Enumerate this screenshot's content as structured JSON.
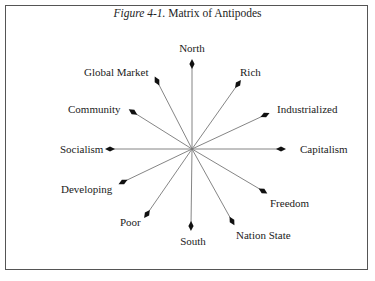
{
  "title": {
    "italic": "Figure 4-1.",
    "rest": " Matrix of Antipodes"
  },
  "center": [
    192,
    149
  ],
  "spokes": [
    {
      "label": "North",
      "tip": [
        192,
        64
      ],
      "lx": 192,
      "ly": 42,
      "anchor": "c"
    },
    {
      "label": "Rich",
      "tip": [
        238,
        84
      ],
      "lx": 240,
      "ly": 66,
      "anchor": "l"
    },
    {
      "label": "Industrialized",
      "tip": [
        265,
        115
      ],
      "lx": 277,
      "ly": 103,
      "anchor": "l"
    },
    {
      "label": "Capitalism",
      "tip": [
        281,
        149
      ],
      "lx": 300,
      "ly": 143,
      "anchor": "l"
    },
    {
      "label": "Freedom",
      "tip": [
        263,
        191
      ],
      "lx": 270,
      "ly": 197,
      "anchor": "l"
    },
    {
      "label": "Nation State",
      "tip": [
        232,
        221
      ],
      "lx": 236,
      "ly": 229,
      "anchor": "l"
    },
    {
      "label": "South",
      "tip": [
        191,
        226
      ],
      "lx": 193,
      "ly": 235,
      "anchor": "c"
    },
    {
      "label": "Poor",
      "tip": [
        147,
        214
      ],
      "lx": 120,
      "ly": 216,
      "anchor": "l"
    },
    {
      "label": "Developing",
      "tip": [
        123,
        182
      ],
      "lx": 61,
      "ly": 183,
      "anchor": "l"
    },
    {
      "label": "Socialism",
      "tip": [
        110,
        149
      ],
      "lx": 60,
      "ly": 143,
      "anchor": "l"
    },
    {
      "label": "Community",
      "tip": [
        133,
        112
      ],
      "lx": 68,
      "ly": 103,
      "anchor": "l"
    },
    {
      "label": "Global Market",
      "tip": [
        157,
        81
      ],
      "lx": 84,
      "ly": 66,
      "anchor": "l"
    }
  ]
}
